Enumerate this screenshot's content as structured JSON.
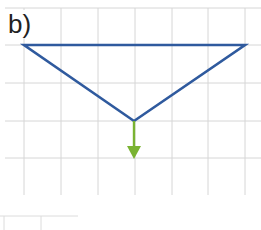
{
  "figure": {
    "label": "b)",
    "colors": {
      "grid": "#d4d4d4",
      "triangle": "#2f5a9e",
      "arrow": "#7ab332",
      "label": "#222222"
    },
    "grid": {
      "vertical_x": [
        24,
        61,
        98,
        135,
        172,
        208,
        245
      ],
      "horizontal_y": [
        8,
        45,
        83,
        121,
        158
      ],
      "x_range": [
        5,
        261
      ],
      "y_range": [
        8,
        195
      ]
    },
    "triangle": {
      "vertices": [
        [
          24,
          45
        ],
        [
          245,
          45
        ],
        [
          134,
          121
        ]
      ]
    },
    "arrow": {
      "from": [
        134,
        121
      ],
      "to": [
        134,
        158
      ],
      "direction": "down"
    },
    "table_fragment": {
      "lines": "partial table outline at bottom-left"
    }
  }
}
